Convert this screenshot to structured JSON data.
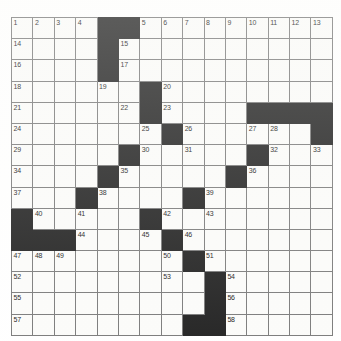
{
  "puzzle": {
    "title": "Crossword Grid",
    "rows": 15,
    "cols": 15,
    "cell_color": "#fbfbf9",
    "block_color": "#0b0b0b",
    "grid_line_color": "#6d6d6d",
    "number_color": "#000000",
    "max_clue_number": 58,
    "grid": [
      [
        {
          "num": "1",
          "block": false
        },
        {
          "num": "2",
          "block": false
        },
        {
          "num": "3",
          "block": false
        },
        {
          "num": "4",
          "block": false
        },
        {
          "num": "",
          "block": true
        },
        {
          "num": "",
          "block": true
        },
        {
          "num": "5",
          "block": false
        },
        {
          "num": "6",
          "block": false
        },
        {
          "num": "7",
          "block": false
        },
        {
          "num": "8",
          "block": false
        },
        {
          "num": "9",
          "block": false
        },
        {
          "num": "10",
          "block": false
        },
        {
          "num": "11",
          "block": false
        },
        {
          "num": "12",
          "block": false
        },
        {
          "num": "13",
          "block": false
        }
      ],
      [
        {
          "num": "14",
          "block": false
        },
        {
          "num": "",
          "block": false
        },
        {
          "num": "",
          "block": false
        },
        {
          "num": "",
          "block": false
        },
        {
          "num": "",
          "block": true
        },
        {
          "num": "15",
          "block": false
        },
        {
          "num": "",
          "block": false
        },
        {
          "num": "",
          "block": false
        },
        {
          "num": "",
          "block": false
        },
        {
          "num": "",
          "block": false
        },
        {
          "num": "",
          "block": false
        },
        {
          "num": "",
          "block": false
        },
        {
          "num": "",
          "block": false
        },
        {
          "num": "",
          "block": false
        },
        {
          "num": "",
          "block": false
        }
      ],
      [
        {
          "num": "16",
          "block": false
        },
        {
          "num": "",
          "block": false
        },
        {
          "num": "",
          "block": false
        },
        {
          "num": "",
          "block": false
        },
        {
          "num": "",
          "block": true
        },
        {
          "num": "17",
          "block": false
        },
        {
          "num": "",
          "block": false
        },
        {
          "num": "",
          "block": false
        },
        {
          "num": "",
          "block": false
        },
        {
          "num": "",
          "block": false
        },
        {
          "num": "",
          "block": false
        },
        {
          "num": "",
          "block": false
        },
        {
          "num": "",
          "block": false
        },
        {
          "num": "",
          "block": false
        },
        {
          "num": "",
          "block": false
        }
      ],
      [
        {
          "num": "18",
          "block": false
        },
        {
          "num": "",
          "block": false
        },
        {
          "num": "",
          "block": false
        },
        {
          "num": "",
          "block": false
        },
        {
          "num": "19",
          "block": false
        },
        {
          "num": "",
          "block": false
        },
        {
          "num": "",
          "block": true
        },
        {
          "num": "20",
          "block": false
        },
        {
          "num": "",
          "block": false
        },
        {
          "num": "",
          "block": false
        },
        {
          "num": "",
          "block": false
        },
        {
          "num": "",
          "block": false
        },
        {
          "num": "",
          "block": false
        },
        {
          "num": "",
          "block": false
        },
        {
          "num": "",
          "block": false
        }
      ],
      [
        {
          "num": "21",
          "block": false
        },
        {
          "num": "",
          "block": false
        },
        {
          "num": "",
          "block": false
        },
        {
          "num": "",
          "block": false
        },
        {
          "num": "",
          "block": false
        },
        {
          "num": "22",
          "block": false
        },
        {
          "num": "",
          "block": true
        },
        {
          "num": "23",
          "block": false
        },
        {
          "num": "",
          "block": false
        },
        {
          "num": "",
          "block": false
        },
        {
          "num": "",
          "block": false
        },
        {
          "num": "",
          "block": true
        },
        {
          "num": "",
          "block": true
        },
        {
          "num": "",
          "block": true
        },
        {
          "num": "",
          "block": true
        }
      ],
      [
        {
          "num": "24",
          "block": false
        },
        {
          "num": "",
          "block": false
        },
        {
          "num": "",
          "block": false
        },
        {
          "num": "",
          "block": false
        },
        {
          "num": "",
          "block": false
        },
        {
          "num": "",
          "block": false
        },
        {
          "num": "25",
          "block": false
        },
        {
          "num": "",
          "block": true
        },
        {
          "num": "26",
          "block": false
        },
        {
          "num": "",
          "block": false
        },
        {
          "num": "",
          "block": false
        },
        {
          "num": "27",
          "block": false
        },
        {
          "num": "28",
          "block": false
        },
        {
          "num": "",
          "block": false
        },
        {
          "num": "",
          "block": true
        }
      ],
      [
        {
          "num": "29",
          "block": false
        },
        {
          "num": "",
          "block": false
        },
        {
          "num": "",
          "block": false
        },
        {
          "num": "",
          "block": false
        },
        {
          "num": "",
          "block": false
        },
        {
          "num": "",
          "block": true
        },
        {
          "num": "30",
          "block": false
        },
        {
          "num": "",
          "block": false
        },
        {
          "num": "31",
          "block": false
        },
        {
          "num": "",
          "block": false
        },
        {
          "num": "",
          "block": false
        },
        {
          "num": "",
          "block": true
        },
        {
          "num": "32",
          "block": false
        },
        {
          "num": "",
          "block": false
        },
        {
          "num": "33",
          "block": false
        }
      ],
      [
        {
          "num": "34",
          "block": false
        },
        {
          "num": "",
          "block": false
        },
        {
          "num": "",
          "block": false
        },
        {
          "num": "",
          "block": false
        },
        {
          "num": "",
          "block": true
        },
        {
          "num": "35",
          "block": false
        },
        {
          "num": "",
          "block": false
        },
        {
          "num": "",
          "block": false
        },
        {
          "num": "",
          "block": false
        },
        {
          "num": "",
          "block": false
        },
        {
          "num": "",
          "block": true
        },
        {
          "num": "36",
          "block": false
        },
        {
          "num": "",
          "block": false
        },
        {
          "num": "",
          "block": false
        },
        {
          "num": "",
          "block": false
        }
      ],
      [
        {
          "num": "37",
          "block": false
        },
        {
          "num": "",
          "block": false
        },
        {
          "num": "",
          "block": false
        },
        {
          "num": "",
          "block": true
        },
        {
          "num": "38",
          "block": false
        },
        {
          "num": "",
          "block": false
        },
        {
          "num": "",
          "block": false
        },
        {
          "num": "",
          "block": false
        },
        {
          "num": "",
          "block": true
        },
        {
          "num": "39",
          "block": false
        },
        {
          "num": "",
          "block": false
        },
        {
          "num": "",
          "block": false
        },
        {
          "num": "",
          "block": false
        },
        {
          "num": "",
          "block": false
        },
        {
          "num": "",
          "block": false
        }
      ],
      [
        {
          "num": "",
          "block": true
        },
        {
          "num": "40",
          "block": false
        },
        {
          "num": "",
          "block": false
        },
        {
          "num": "41",
          "block": false
        },
        {
          "num": "",
          "block": false
        },
        {
          "num": "",
          "block": false
        },
        {
          "num": "",
          "block": true
        },
        {
          "num": "42",
          "block": false
        },
        {
          "num": "",
          "block": false
        },
        {
          "num": "43",
          "block": false
        },
        {
          "num": "",
          "block": false
        },
        {
          "num": "",
          "block": false
        },
        {
          "num": "",
          "block": false
        },
        {
          "num": "",
          "block": false
        },
        {
          "num": "",
          "block": false
        }
      ],
      [
        {
          "num": "",
          "block": true
        },
        {
          "num": "",
          "block": true
        },
        {
          "num": "",
          "block": true
        },
        {
          "num": "44",
          "block": false
        },
        {
          "num": "",
          "block": false
        },
        {
          "num": "",
          "block": false
        },
        {
          "num": "45",
          "block": false
        },
        {
          "num": "",
          "block": true
        },
        {
          "num": "46",
          "block": false
        },
        {
          "num": "",
          "block": false
        },
        {
          "num": "",
          "block": false
        },
        {
          "num": "",
          "block": false
        },
        {
          "num": "",
          "block": false
        },
        {
          "num": "",
          "block": false
        },
        {
          "num": "",
          "block": false
        }
      ],
      [
        {
          "num": "47",
          "block": false
        },
        {
          "num": "48",
          "block": false
        },
        {
          "num": "49",
          "block": false
        },
        {
          "num": "",
          "block": false
        },
        {
          "num": "",
          "block": false
        },
        {
          "num": "",
          "block": false
        },
        {
          "num": "",
          "block": false
        },
        {
          "num": "50",
          "block": false
        },
        {
          "num": "",
          "block": true
        },
        {
          "num": "51",
          "block": false
        },
        {
          "num": "",
          "block": false
        },
        {
          "num": "",
          "block": false
        },
        {
          "num": "",
          "block": false
        },
        {
          "num": "",
          "block": false
        },
        {
          "num": "",
          "block": false
        }
      ],
      [
        {
          "num": "52",
          "block": false
        },
        {
          "num": "",
          "block": false
        },
        {
          "num": "",
          "block": false
        },
        {
          "num": "",
          "block": false
        },
        {
          "num": "",
          "block": false
        },
        {
          "num": "",
          "block": false
        },
        {
          "num": "",
          "block": false
        },
        {
          "num": "53",
          "block": false
        },
        {
          "num": "",
          "block": false
        },
        {
          "num": "",
          "block": true
        },
        {
          "num": "54",
          "block": false
        },
        {
          "num": "",
          "block": false
        },
        {
          "num": "",
          "block": false
        },
        {
          "num": "",
          "block": false
        },
        {
          "num": "",
          "block": false
        }
      ],
      [
        {
          "num": "55",
          "block": false
        },
        {
          "num": "",
          "block": false
        },
        {
          "num": "",
          "block": false
        },
        {
          "num": "",
          "block": false
        },
        {
          "num": "",
          "block": false
        },
        {
          "num": "",
          "block": false
        },
        {
          "num": "",
          "block": false
        },
        {
          "num": "",
          "block": false
        },
        {
          "num": "",
          "block": false
        },
        {
          "num": "",
          "block": true
        },
        {
          "num": "56",
          "block": false
        },
        {
          "num": "",
          "block": false
        },
        {
          "num": "",
          "block": false
        },
        {
          "num": "",
          "block": false
        },
        {
          "num": "",
          "block": false
        }
      ],
      [
        {
          "num": "57",
          "block": false
        },
        {
          "num": "",
          "block": false
        },
        {
          "num": "",
          "block": false
        },
        {
          "num": "",
          "block": false
        },
        {
          "num": "",
          "block": false
        },
        {
          "num": "",
          "block": false
        },
        {
          "num": "",
          "block": false
        },
        {
          "num": "",
          "block": false
        },
        {
          "num": "",
          "block": true
        },
        {
          "num": "",
          "block": true
        },
        {
          "num": "58",
          "block": false
        },
        {
          "num": "",
          "block": false
        },
        {
          "num": "",
          "block": false
        },
        {
          "num": "",
          "block": false
        },
        {
          "num": "",
          "block": false
        }
      ]
    ]
  }
}
